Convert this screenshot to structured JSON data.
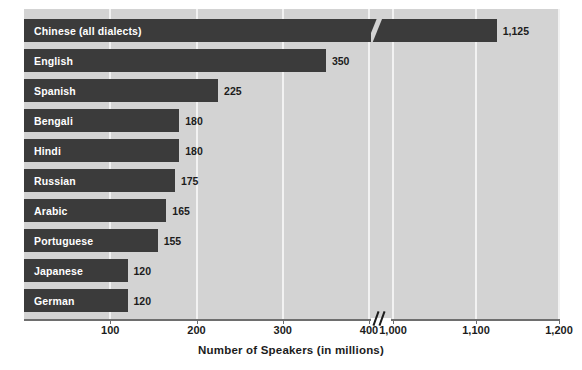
{
  "chart_data": {
    "type": "bar",
    "orientation": "horizontal",
    "title": "",
    "xlabel": "Number of Speakers (in millions)",
    "ylabel": "",
    "categories": [
      "Chinese (all dialects)",
      "English",
      "Spanish",
      "Bengali",
      "Hindi",
      "Russian",
      "Arabic",
      "Portuguese",
      "Japanese",
      "German"
    ],
    "values": [
      1125,
      350,
      225,
      180,
      180,
      175,
      165,
      155,
      120,
      120
    ],
    "value_labels": [
      "1,125",
      "350",
      "225",
      "180",
      "180",
      "175",
      "165",
      "155",
      "120",
      "120"
    ],
    "xtick_labels": [
      "100",
      "200",
      "300",
      "400",
      "1,000",
      "1,100",
      "1,200"
    ],
    "xtick_values": [
      100,
      200,
      300,
      400,
      1000,
      1100,
      1200
    ],
    "xlim": [
      0,
      1200
    ],
    "axis_break": true,
    "axis_break_between": [
      400,
      1000
    ],
    "grid": true,
    "grid_axis": "x",
    "legend": "none",
    "colors": {
      "bar": "#3b3b3b",
      "plot_background": "#d3d3d3",
      "gridline": "#f2f2f2",
      "axis": "#6e6e6e",
      "bar_label_text": "#ffffff",
      "value_label_text": "#1c1c1c",
      "page_background": "#ffffff"
    }
  }
}
